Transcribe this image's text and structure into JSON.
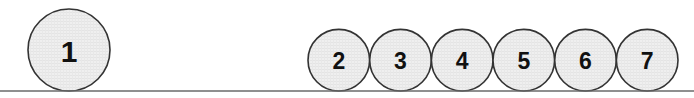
{
  "figure": {
    "name": "circles-resting-on-line",
    "width": 694,
    "height": 98,
    "background_color": "#ffffff",
    "baseline": {
      "label": "ground-line",
      "y": 91,
      "x_start": 0,
      "x_end": 694,
      "color": "#6a6a6a",
      "thickness": 1.6
    },
    "style": {
      "circle_fill": "#ededed",
      "circle_stroke": "#333333",
      "circle_stroke_width": 1.6,
      "label_color": "#111111",
      "texture_color": "#dcdcdc"
    },
    "circles": [
      {
        "label": "1",
        "cx": 69,
        "cy": 50,
        "r": 41,
        "font_size": 30,
        "group": "large"
      },
      {
        "label": "2",
        "cx": 338.8,
        "cy": 60.2,
        "r": 30.8,
        "font_size": 23,
        "group": "small"
      },
      {
        "label": "3",
        "cx": 400.5,
        "cy": 60.2,
        "r": 30.8,
        "font_size": 23,
        "group": "small"
      },
      {
        "label": "4",
        "cx": 462.2,
        "cy": 60.2,
        "r": 30.8,
        "font_size": 23,
        "group": "small"
      },
      {
        "label": "5",
        "cx": 523.8,
        "cy": 60.2,
        "r": 30.8,
        "font_size": 23,
        "group": "small"
      },
      {
        "label": "6",
        "cx": 585.5,
        "cy": 60.2,
        "r": 30.8,
        "font_size": 23,
        "group": "small"
      },
      {
        "label": "7",
        "cx": 647.2,
        "cy": 60.2,
        "r": 30.8,
        "font_size": 23,
        "group": "small"
      }
    ]
  }
}
